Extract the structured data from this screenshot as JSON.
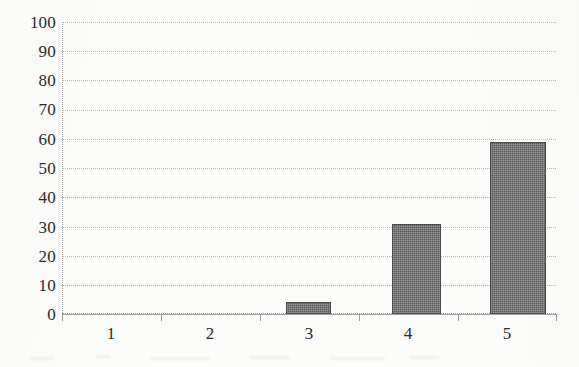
{
  "chart_data": {
    "type": "bar",
    "title": "",
    "subtitle": "",
    "xlabel": "",
    "ylabel": "",
    "categories": [
      "1",
      "2",
      "3",
      "4",
      "5"
    ],
    "values": [
      0,
      0,
      4,
      31,
      59
    ],
    "series": [
      {
        "name": "",
        "values": [
          0,
          0,
          4,
          31,
          59
        ]
      }
    ],
    "ylim": [
      0,
      100
    ],
    "y_ticks": [
      0,
      10,
      20,
      30,
      40,
      50,
      60,
      70,
      80,
      90,
      100
    ],
    "y_tick_labels": [
      "0",
      "10",
      "20",
      "30",
      "40",
      "50",
      "60",
      "70",
      "80",
      "90",
      "100"
    ],
    "x_tick_labels": [
      "1",
      "2",
      "3",
      "4",
      "5"
    ],
    "grid": "horizontal-dotted",
    "legend": "none",
    "annotations": [],
    "colors": {
      "bar_fill": "#5b5b5b",
      "bar_edge": "#4a4a4a",
      "gridline": "#b9b9b9",
      "axis": "#a6a6a6",
      "text": "#2b2b2b",
      "background": "#fcfcfb"
    }
  }
}
